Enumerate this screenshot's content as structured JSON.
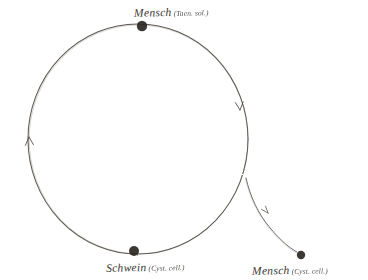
{
  "figure": {
    "background_color": "#ffffff",
    "ink_color": "#4a453f",
    "node_color": "#2b2723",
    "width": 368,
    "height": 280
  },
  "nodes": [
    {
      "id": "node-top",
      "name": "mensch-taenia-node",
      "label_main": "Mensch",
      "label_paren": "(Taen. sol.)",
      "x": 142,
      "y": 26,
      "radius": 5.2
    },
    {
      "id": "node-bottom",
      "name": "schwein-cysticercus-node",
      "label_main": "Schwein",
      "label_paren": "(Cyst. cell.)",
      "x": 134,
      "y": 251,
      "radius": 5.0
    },
    {
      "id": "node-bottom-right",
      "name": "mensch-cysticercus-node",
      "label_main": "Mensch",
      "label_paren": "(Cyst. cell.)",
      "x": 301,
      "y": 255,
      "radius": 4.2
    }
  ],
  "cycle": {
    "name": "life-cycle-circle",
    "center_x": 138,
    "center_y": 139,
    "radius_x": 110,
    "radius_y": 115
  },
  "branch": {
    "name": "branch-path-to-human",
    "start_x": 246,
    "start_y": 178,
    "end_x": 297,
    "end_y": 252
  },
  "arrows": [
    {
      "name": "arrowhead-left-ascending",
      "x": 29,
      "y": 137,
      "rotation": -8
    },
    {
      "name": "arrowhead-right-descending",
      "x": 240,
      "y": 108,
      "rotation": 168
    },
    {
      "name": "arrowhead-branch-descending",
      "x": 267,
      "y": 212,
      "rotation": 143
    }
  ]
}
